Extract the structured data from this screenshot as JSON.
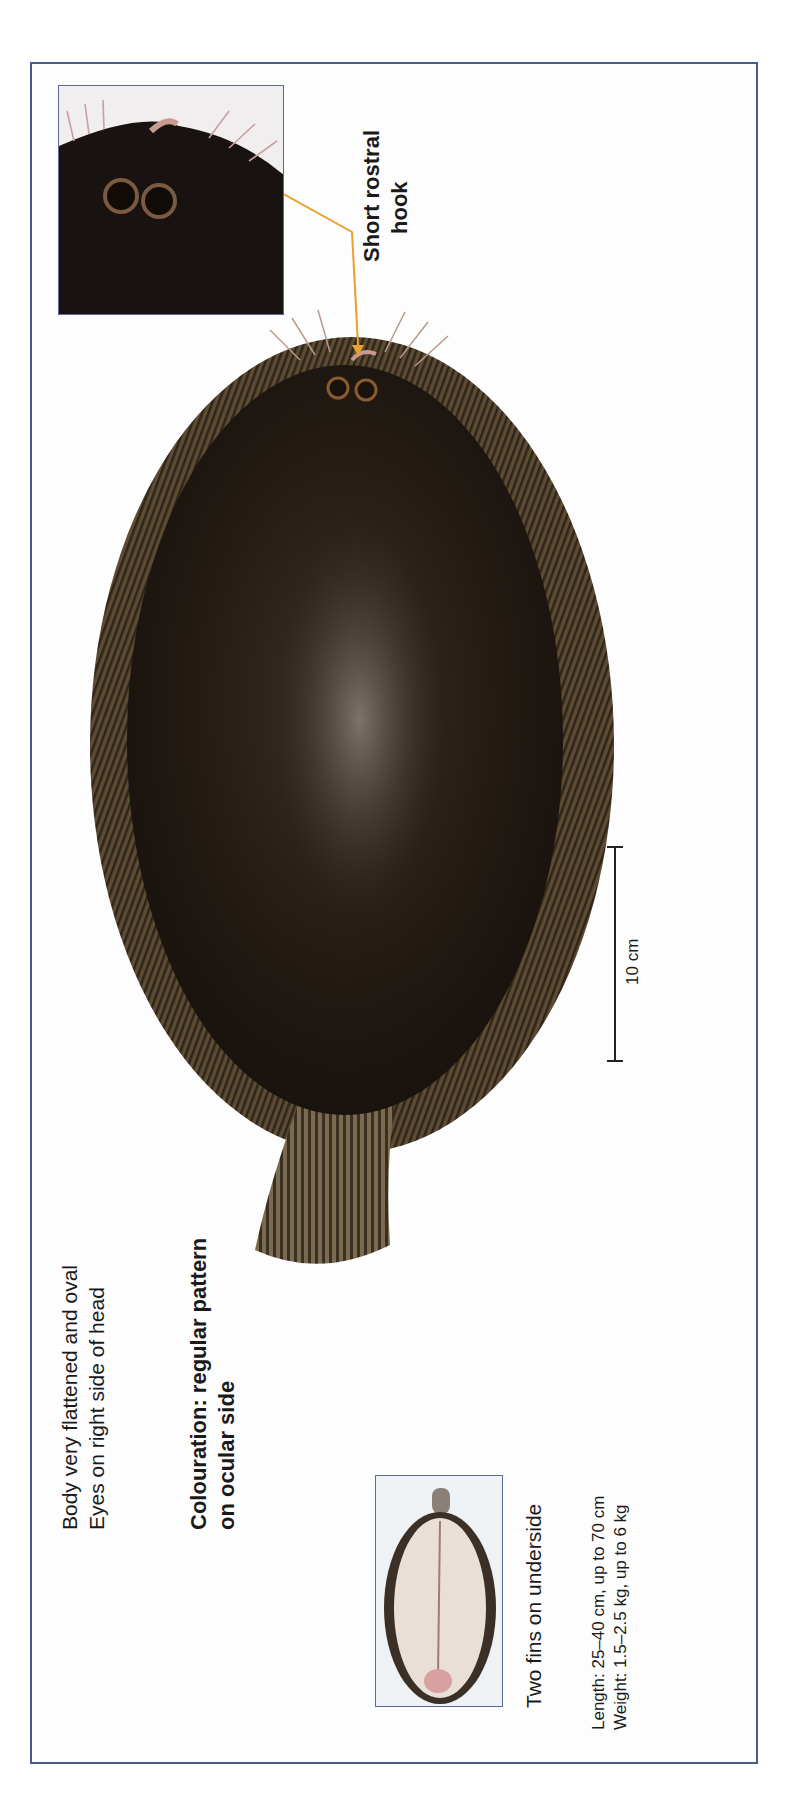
{
  "labels": {
    "body_line1": "Body very flattened and oval",
    "body_line2": "Eyes on right side of head",
    "colouration_line1": "Colouration: regular pattern",
    "colouration_line2": "on ocular side",
    "underside": "Two fins on underside",
    "length": "Length: 25–40 cm, up to 70 cm",
    "weight": "Weight: 1.5–2.5 kg, up to 6 kg",
    "rostral_line1": "Short rostral",
    "rostral_line2": "hook",
    "scale": "10 cm"
  },
  "colors": {
    "frame_border": "#4a5a8a",
    "callout_arrow": "#e8a030",
    "fish_body": "#2a2118",
    "fin_fringe": "#6b5a3c",
    "underside_body": "#e8dcd2"
  },
  "images": {
    "main": "sole-ocular-side",
    "head_inset": "sole-head-closeup",
    "underside_inset": "sole-blind-side"
  }
}
